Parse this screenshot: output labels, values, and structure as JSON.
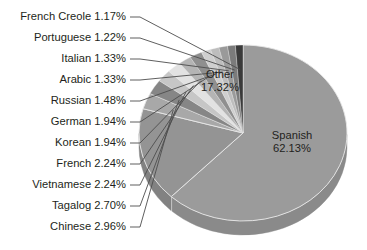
{
  "chart_data": {
    "type": "pie",
    "title": "",
    "subtitle": "",
    "xlabel": "",
    "ylabel": "",
    "legend_position": "none",
    "grid": false,
    "three_d": true,
    "start_angle_deg": 0,
    "direction": "clockwise",
    "units": "percent",
    "categories": [
      "Spanish",
      "Other",
      "Chinese",
      "Tagalog",
      "Vietnamese",
      "French",
      "Korean",
      "German",
      "Russian",
      "Arabic",
      "Italian",
      "Portuguese",
      "French Creole"
    ],
    "values": [
      62.13,
      17.32,
      2.96,
      2.7,
      2.24,
      2.24,
      1.94,
      1.94,
      1.48,
      1.33,
      1.33,
      1.22,
      1.17
    ],
    "slices": [
      {
        "label": "Spanish",
        "value": 62.13,
        "value_text": "62.13%",
        "color": "#9b9b9b",
        "side_color": "#8a8a8a",
        "label_placement": "inside"
      },
      {
        "label": "Other",
        "value": 17.32,
        "value_text": "17.32%",
        "color": "#949494",
        "side_color": "#828282",
        "label_placement": "inside"
      },
      {
        "label": "Chinese",
        "value": 2.96,
        "value_text": "2.96%",
        "color": "#a8a8a8",
        "side_color": "#929292",
        "label_placement": "callout"
      },
      {
        "label": "Tagalog",
        "value": 2.7,
        "value_text": "2.70%",
        "color": "#868686",
        "side_color": "#747474",
        "label_placement": "callout"
      },
      {
        "label": "Vietnamese",
        "value": 2.24,
        "value_text": "2.24%",
        "color": "#c6c6c6",
        "side_color": "#ababab",
        "label_placement": "callout"
      },
      {
        "label": "French",
        "value": 2.24,
        "value_text": "2.24%",
        "color": "#e2e2e2",
        "side_color": "#c3c3c3",
        "label_placement": "callout"
      },
      {
        "label": "Korean",
        "value": 1.94,
        "value_text": "1.94%",
        "color": "#b4b4b4",
        "side_color": "#9c9c9c",
        "label_placement": "callout"
      },
      {
        "label": "German",
        "value": 1.94,
        "value_text": "1.94%",
        "color": "#8f8f8f",
        "side_color": "#7d7d7d",
        "label_placement": "callout"
      },
      {
        "label": "Russian",
        "value": 1.48,
        "value_text": "1.48%",
        "color": "#cfcfcf",
        "side_color": "#b2b2b2",
        "label_placement": "callout"
      },
      {
        "label": "Arabic",
        "value": 1.33,
        "value_text": "1.33%",
        "color": "#bdbdbd",
        "side_color": "#a3a3a3",
        "label_placement": "callout"
      },
      {
        "label": "Italian",
        "value": 1.33,
        "value_text": "1.33%",
        "color": "#9a9a9a",
        "side_color": "#878787",
        "label_placement": "callout"
      },
      {
        "label": "Portuguese",
        "value": 1.22,
        "value_text": "1.22%",
        "color": "#7b7b7b",
        "side_color": "#6b6b6b",
        "label_placement": "callout"
      },
      {
        "label": "French Creole",
        "value": 1.17,
        "value_text": "1.17%",
        "color": "#3a3a3a",
        "side_color": "#2e2e2e",
        "label_placement": "callout"
      }
    ],
    "callout_labels": [
      {
        "label": "French Creole",
        "value_text": "1.17%",
        "text": "French Creole 1.17%",
        "y": 17
      },
      {
        "label": "Portuguese",
        "value_text": "1.22%",
        "text": "Portuguese 1.22%",
        "y": 38
      },
      {
        "label": "Italian",
        "value_text": "1.33%",
        "text": "Italian 1.33%",
        "y": 59
      },
      {
        "label": "Arabic",
        "value_text": "1.33%",
        "text": "Arabic 1.33%",
        "y": 80
      },
      {
        "label": "Russian",
        "value_text": "1.48%",
        "text": "Russian 1.48%",
        "y": 101
      },
      {
        "label": "German",
        "value_text": "1.94%",
        "text": "German 1.94%",
        "y": 122
      },
      {
        "label": "Korean",
        "value_text": "1.94%",
        "text": "Korean 1.94%",
        "y": 143
      },
      {
        "label": "French",
        "value_text": "2.24%",
        "text": "French 2.24%",
        "y": 164
      },
      {
        "label": "Vietnamese",
        "value_text": "2.24%",
        "text": "Vietnamese 2.24%",
        "y": 185
      },
      {
        "label": "Tagalog",
        "value_text": "2.70%",
        "text": "Tagalog 2.70%",
        "y": 206
      },
      {
        "label": "Chinese",
        "value_text": "2.96%",
        "text": "Chinese 2.96%",
        "y": 227
      }
    ],
    "inside_labels": [
      {
        "label": "Other",
        "value_text": "17.32%",
        "x": 220,
        "y": 78
      },
      {
        "label": "Spanish",
        "value_text": "62.13%",
        "x": 292,
        "y": 139
      }
    ],
    "geometry": {
      "cx": 243,
      "cy": 133,
      "rx": 104,
      "ry": 88,
      "depth": 14,
      "label_right_x": 126,
      "leader_elbow_x": 140,
      "callout_hub_x": 152,
      "callout_hub_y": 96
    },
    "colors": {
      "background": "#ffffff",
      "text": "#231f20",
      "leader_line": "#4d4d4d",
      "slice_outline": "#e8e8e8"
    }
  }
}
